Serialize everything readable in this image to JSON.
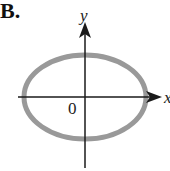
{
  "figure": {
    "option_label": "B.",
    "x_axis_label": "x",
    "y_axis_label": "y",
    "origin_label": "0",
    "shape": "ellipse",
    "ellipse": {
      "cx": 85,
      "cy": 97,
      "rx": 61,
      "ry": 42,
      "stroke": "#999999",
      "stroke_width": 5
    },
    "axis_color": "#1a1a1a"
  }
}
